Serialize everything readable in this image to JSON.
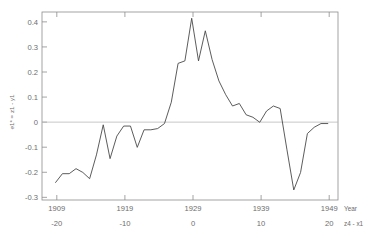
{
  "chart_data": {
    "type": "line",
    "title": "",
    "xlabel": "Year",
    "xlabel_secondary": "z4 - x1",
    "ylabel": "e1* = z1 - y1",
    "xlim": [
      1907,
      1950.5
    ],
    "ylim": [
      -0.3,
      0.45
    ],
    "grid": false,
    "legend": "none",
    "zero_reference_line": 0,
    "x_axis_primary": {
      "name": "Year",
      "ticks": [
        1909,
        1919,
        1929,
        1939,
        1949
      ],
      "tick_labels": [
        "1909",
        "1919",
        "1929",
        "1939",
        "1949"
      ]
    },
    "x_axis_secondary": {
      "name": "z4 - x1",
      "ticks": [
        -20,
        -10,
        0,
        10,
        20
      ],
      "tick_labels": [
        "-20",
        "-10",
        "0",
        "10",
        "20"
      ]
    },
    "y_axis": {
      "ticks": [
        -0.3,
        -0.2,
        -0.1,
        0,
        0.1,
        0.2,
        0.3,
        0.4
      ],
      "tick_labels": [
        "-0.3",
        "-0.2",
        "-0.1",
        "0",
        "0.1",
        "0.2",
        "0.3",
        "0.4"
      ]
    },
    "series": [
      {
        "name": "residual",
        "color": "#4a4a4a",
        "x": [
          1909,
          1910,
          1911,
          1912,
          1913,
          1914,
          1915,
          1916,
          1917,
          1918,
          1919,
          1920,
          1921,
          1922,
          1923,
          1924,
          1925,
          1926,
          1927,
          1928,
          1929,
          1930,
          1931,
          1932,
          1933,
          1934,
          1935,
          1936,
          1937,
          1938,
          1939,
          1940,
          1941,
          1942,
          1943,
          1944,
          1945,
          1946,
          1947,
          1948,
          1949
        ],
        "values": [
          -0.23,
          -0.195,
          -0.195,
          -0.175,
          -0.19,
          -0.215,
          -0.12,
          0.0,
          -0.135,
          -0.045,
          -0.005,
          -0.005,
          -0.09,
          -0.02,
          -0.02,
          -0.015,
          0.005,
          0.09,
          0.245,
          0.255,
          0.425,
          0.255,
          0.375,
          0.26,
          0.175,
          0.12,
          0.075,
          0.085,
          0.04,
          0.03,
          0.01,
          0.055,
          0.075,
          0.065,
          -0.1,
          -0.26,
          -0.19,
          -0.035,
          -0.01,
          0.005,
          0.005
        ]
      }
    ]
  }
}
